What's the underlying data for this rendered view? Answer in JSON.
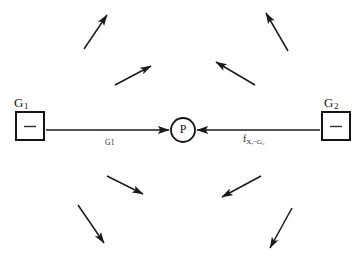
{
  "figure": {
    "background_color": "#ffffff",
    "stroke_color": "#1a1a1a",
    "width": 361,
    "height": 266
  },
  "bodies": [
    {
      "id": "g1",
      "label_base": "G",
      "label_sub": "1",
      "inner_mark": "minus-dash",
      "box": {
        "x": 16,
        "y": 112,
        "w": 28,
        "h": 28
      }
    },
    {
      "id": "g2",
      "label_base": "G",
      "label_sub": "2",
      "inner_mark": "minus-dash",
      "box": {
        "x": 322,
        "y": 112,
        "w": 28,
        "h": 28
      }
    }
  ],
  "point": {
    "letter": "P",
    "cx": 183,
    "cy": 130,
    "r": 12
  },
  "force_arrows": [
    {
      "id": "force-from-g1",
      "label_base": "G",
      "label_sub": "1",
      "from": {
        "x": 46,
        "y": 130
      },
      "to": {
        "x": 169,
        "y": 130
      },
      "direction": "right"
    },
    {
      "id": "force-from-g2",
      "label_base": "f",
      "label_sub": "X,−G₂",
      "from": {
        "x": 320,
        "y": 130
      },
      "to": {
        "x": 197,
        "y": 130
      },
      "direction": "left"
    }
  ],
  "field_arrows": [
    {
      "id": "field-arrow-ul-outer",
      "from": {
        "x": 84,
        "y": 49
      },
      "to": {
        "x": 107,
        "y": 15
      },
      "quadrant": "upper-left"
    },
    {
      "id": "field-arrow-ul-inner",
      "from": {
        "x": 115,
        "y": 85
      },
      "to": {
        "x": 151,
        "y": 66
      },
      "quadrant": "upper-left"
    },
    {
      "id": "field-arrow-ur-outer",
      "from": {
        "x": 288,
        "y": 51
      },
      "to": {
        "x": 266,
        "y": 13
      },
      "quadrant": "upper-right"
    },
    {
      "id": "field-arrow-ur-inner",
      "from": {
        "x": 255,
        "y": 85
      },
      "to": {
        "x": 216,
        "y": 62
      },
      "quadrant": "upper-right"
    },
    {
      "id": "field-arrow-ll-inner",
      "from": {
        "x": 107,
        "y": 176
      },
      "to": {
        "x": 143,
        "y": 194
      },
      "quadrant": "lower-left"
    },
    {
      "id": "field-arrow-ll-outer",
      "from": {
        "x": 78,
        "y": 205
      },
      "to": {
        "x": 104,
        "y": 243
      },
      "quadrant": "lower-left"
    },
    {
      "id": "field-arrow-lr-inner",
      "from": {
        "x": 261,
        "y": 176
      },
      "to": {
        "x": 222,
        "y": 197
      },
      "quadrant": "lower-right"
    },
    {
      "id": "field-arrow-lr-outer",
      "from": {
        "x": 292,
        "y": 208
      },
      "to": {
        "x": 270,
        "y": 248
      },
      "quadrant": "lower-right"
    }
  ]
}
